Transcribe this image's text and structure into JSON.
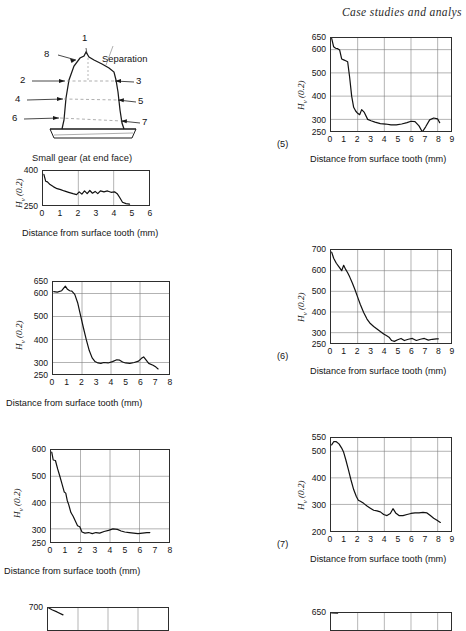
{
  "header": {
    "running_title": "Case studies and analys"
  },
  "figure": {
    "caption": "Small gear (at end face)",
    "separation_label": "Separation",
    "point_labels": [
      "1",
      "2",
      "3",
      "4",
      "5",
      "6",
      "7",
      "8"
    ]
  },
  "axis_text": {
    "y_label": "H",
    "y_label_sub": "v",
    "y_label_tail": " (0.2)",
    "x_label": "Distance from surface tooth (mm)"
  },
  "chart_data": [
    {
      "id": "chart-1",
      "type": "line",
      "number": "",
      "title": "",
      "xlabel": "Distance from surface tooth (mm)",
      "ylabel": "Hv (0.2)",
      "xlim": [
        0,
        6
      ],
      "ylim": [
        250,
        400
      ],
      "yticks": [
        250,
        400
      ],
      "xticks": [
        0,
        1,
        2,
        3,
        4,
        5,
        6
      ],
      "grid": true,
      "x": [
        0.05,
        0.15,
        0.25,
        0.4,
        0.6,
        0.8,
        1.0,
        1.2,
        1.45,
        1.7,
        1.9,
        2.05,
        2.2,
        2.35,
        2.5,
        2.65,
        2.8,
        2.95,
        3.1,
        3.25,
        3.45,
        3.65,
        3.85,
        4.05,
        4.2,
        4.35,
        4.5,
        4.7,
        4.9
      ],
      "y": [
        385,
        355,
        352,
        340,
        330,
        322,
        318,
        312,
        306,
        300,
        296,
        308,
        298,
        312,
        300,
        314,
        302,
        310,
        300,
        312,
        308,
        312,
        306,
        308,
        300,
        282,
        262,
        256,
        254
      ]
    },
    {
      "id": "chart-2",
      "type": "line",
      "number": "",
      "title": "",
      "xlabel": "Distance from surface tooth (mm)",
      "ylabel": "Hv (0.2)",
      "xlim": [
        0,
        8
      ],
      "ylim": [
        250,
        650
      ],
      "yticks": [
        250,
        300,
        400,
        500,
        600,
        650
      ],
      "xticks": [
        0,
        1,
        2,
        3,
        4,
        5,
        6,
        7,
        8
      ],
      "grid": true,
      "x": [
        0.05,
        0.3,
        0.6,
        0.85,
        1.0,
        1.15,
        1.3,
        1.5,
        1.7,
        1.9,
        2.1,
        2.3,
        2.5,
        2.7,
        2.9,
        3.1,
        3.3,
        3.5,
        3.8,
        4.1,
        4.4,
        4.6,
        4.8,
        5.0,
        5.3,
        5.6,
        5.9,
        6.1,
        6.25,
        6.4,
        6.6,
        6.9,
        7.1,
        7.25
      ],
      "y": [
        608,
        606,
        612,
        632,
        618,
        612,
        610,
        596,
        560,
        505,
        450,
        398,
        352,
        320,
        304,
        298,
        296,
        300,
        298,
        304,
        312,
        310,
        302,
        298,
        296,
        300,
        306,
        318,
        324,
        312,
        296,
        288,
        280,
        272
      ]
    },
    {
      "id": "chart-3",
      "type": "line",
      "number": "",
      "title": "",
      "xlabel": "Distance from surface tooth (mm)",
      "ylabel": "Hv (0.2)",
      "xlim": [
        0,
        8
      ],
      "ylim": [
        250,
        600
      ],
      "yticks": [
        250,
        300,
        400,
        500,
        600
      ],
      "xticks": [
        0,
        1,
        2,
        3,
        4,
        5,
        6,
        7,
        8
      ],
      "grid": true,
      "x": [
        0.05,
        0.15,
        0.3,
        0.45,
        0.6,
        0.75,
        0.9,
        1.0,
        1.1,
        1.2,
        1.35,
        1.5,
        1.65,
        1.8,
        1.95,
        2.1,
        2.3,
        2.55,
        2.8,
        3.05,
        3.3,
        3.6,
        3.9,
        4.2,
        4.5,
        4.75,
        5.0,
        5.3,
        5.6,
        5.9,
        6.2,
        6.5,
        6.7
      ],
      "y": [
        592,
        562,
        560,
        528,
        500,
        470,
        440,
        436,
        408,
        392,
        362,
        348,
        330,
        312,
        308,
        288,
        284,
        286,
        282,
        286,
        284,
        290,
        294,
        300,
        298,
        292,
        288,
        286,
        284,
        282,
        284,
        286,
        286
      ]
    },
    {
      "id": "chart-4",
      "type": "line",
      "number": "",
      "title": "",
      "xlabel": "",
      "ylabel": "",
      "xlim": [
        0,
        8
      ],
      "ylim": [
        250,
        700
      ],
      "yticks": [
        700
      ],
      "xticks": [],
      "grid": true,
      "x": [
        0.05,
        0.3,
        0.6,
        1.0
      ],
      "y": [
        700,
        660,
        620,
        560
      ]
    },
    {
      "id": "chart-5",
      "type": "line",
      "number": "(5)",
      "title": "",
      "xlabel": "Distance from surface tooth (mm)",
      "ylabel": "Hv (0.2)",
      "xlim": [
        0,
        9
      ],
      "ylim": [
        250,
        650
      ],
      "yticks": [
        250,
        300,
        400,
        500,
        600,
        650
      ],
      "xticks": [
        0,
        1,
        2,
        3,
        4,
        5,
        6,
        7,
        8,
        9
      ],
      "grid": true,
      "x": [
        0.05,
        0.2,
        0.35,
        0.5,
        0.65,
        0.8,
        0.95,
        1.1,
        1.25,
        1.4,
        1.55,
        1.7,
        1.85,
        2.0,
        2.15,
        2.3,
        2.5,
        2.75,
        3.0,
        3.3,
        3.7,
        4.1,
        4.5,
        4.9,
        5.3,
        5.7,
        6.0,
        6.3,
        6.6,
        6.85,
        7.1,
        7.4,
        7.7,
        8.0,
        8.15
      ],
      "y": [
        648,
        612,
        606,
        604,
        598,
        560,
        556,
        552,
        548,
        480,
        400,
        352,
        336,
        326,
        320,
        342,
        330,
        300,
        294,
        288,
        282,
        280,
        276,
        276,
        280,
        286,
        292,
        290,
        272,
        246,
        268,
        298,
        306,
        302,
        286
      ]
    },
    {
      "id": "chart-6",
      "type": "line",
      "number": "(6)",
      "title": "",
      "xlabel": "Distance from surface tooth (mm)",
      "ylabel": "Hv (0.2)",
      "xlim": [
        0,
        9
      ],
      "ylim": [
        250,
        700
      ],
      "yticks": [
        250,
        300,
        400,
        500,
        600,
        700
      ],
      "xticks": [
        0,
        1,
        2,
        3,
        4,
        5,
        6,
        7,
        8,
        9
      ],
      "grid": true,
      "x": [
        0.05,
        0.2,
        0.4,
        0.6,
        0.8,
        0.95,
        1.1,
        1.25,
        1.4,
        1.6,
        1.8,
        2.0,
        2.2,
        2.45,
        2.7,
        2.95,
        3.2,
        3.45,
        3.7,
        3.95,
        4.15,
        4.35,
        4.55,
        4.75,
        5.0,
        5.25,
        5.5,
        5.8,
        6.1,
        6.4,
        6.7,
        7.0,
        7.3,
        7.6,
        7.9,
        8.05
      ],
      "y": [
        690,
        660,
        636,
        618,
        600,
        626,
        606,
        590,
        570,
        540,
        508,
        472,
        436,
        398,
        366,
        344,
        330,
        318,
        306,
        294,
        286,
        278,
        262,
        258,
        266,
        272,
        262,
        268,
        272,
        262,
        268,
        272,
        264,
        268,
        270,
        270
      ]
    },
    {
      "id": "chart-7",
      "type": "line",
      "number": "(7)",
      "title": "",
      "xlabel": "Distance from surface tooth (mm)",
      "ylabel": "Hv (0.2)",
      "xlim": [
        0,
        9
      ],
      "ylim": [
        200,
        550
      ],
      "yticks": [
        200,
        300,
        400,
        500,
        550
      ],
      "xticks": [
        0,
        1,
        2,
        3,
        4,
        5,
        6,
        7,
        8,
        9
      ],
      "grid": true,
      "x": [
        0.05,
        0.2,
        0.4,
        0.6,
        0.8,
        0.95,
        1.1,
        1.3,
        1.5,
        1.7,
        1.9,
        2.05,
        2.2,
        2.45,
        2.7,
        2.95,
        3.2,
        3.45,
        3.7,
        3.95,
        4.2,
        4.45,
        4.65,
        4.85,
        5.1,
        5.4,
        5.7,
        6.0,
        6.3,
        6.6,
        6.9,
        7.2,
        7.45,
        7.7,
        7.95,
        8.2
      ],
      "y": [
        524,
        536,
        536,
        528,
        512,
        496,
        470,
        432,
        392,
        356,
        330,
        316,
        312,
        304,
        294,
        286,
        278,
        276,
        272,
        262,
        258,
        266,
        284,
        268,
        258,
        258,
        262,
        266,
        268,
        268,
        270,
        268,
        258,
        248,
        240,
        232
      ]
    },
    {
      "id": "chart-8",
      "type": "line",
      "number": "",
      "title": "",
      "xlabel": "",
      "ylabel": "",
      "xlim": [
        0,
        9
      ],
      "ylim": [
        250,
        650
      ],
      "yticks": [
        650
      ],
      "xticks": [],
      "grid": true,
      "x": [
        0.05,
        0.5
      ],
      "y": [
        650,
        648
      ]
    }
  ]
}
